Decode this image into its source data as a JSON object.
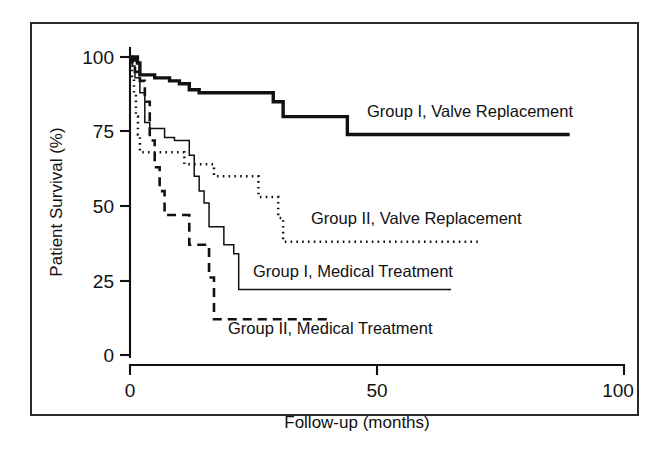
{
  "figure": {
    "kind": "kaplan-meier-survival-plot",
    "background_color": "#ffffff",
    "ink_color": "#111111",
    "frame": {
      "border_color": "#2a2a2a"
    }
  },
  "chart_data": {
    "type": "line",
    "title": "",
    "xlabel": "Follow-up (months)",
    "ylabel": "Patient Survival (%)",
    "xlim": [
      0,
      100
    ],
    "ylim": [
      0,
      100
    ],
    "xticks": [
      0,
      50,
      100
    ],
    "xtick_labels": [
      "0",
      "50",
      "100"
    ],
    "yticks": [
      0,
      25,
      50,
      75,
      100
    ],
    "ytick_labels": [
      "0",
      "25",
      "50",
      "75",
      "100"
    ],
    "grid": false,
    "legend_position": "inline-annotations",
    "step_style": "post",
    "series": [
      {
        "name": "Group I, Valve Replacement",
        "style": "solid-thick",
        "label_x": 62,
        "label_y": 80,
        "x": [
          0,
          0.5,
          1.0,
          1.5,
          2.0,
          3.0,
          5.0,
          8.0,
          10.0,
          12.0,
          14.0,
          26.0,
          29.0,
          31.0,
          44.0,
          89.0
        ],
        "y": [
          100,
          99,
          100,
          98,
          94,
          94,
          93,
          92,
          91,
          89,
          88,
          88,
          85,
          80,
          74,
          74
        ]
      },
      {
        "name": "Group I, Medical Treatment",
        "style": "solid-thin",
        "label_x": 25,
        "label_y": 27,
        "x": [
          0,
          0.5,
          1.0,
          2.0,
          3.0,
          4.0,
          5.0,
          7.0,
          9.0,
          11.0,
          12.0,
          13.0,
          14.0,
          15.0,
          16.0,
          17.0,
          19.0,
          21.0,
          22.0,
          65.0
        ],
        "y": [
          99,
          97,
          93,
          88,
          78,
          76,
          76,
          73,
          72,
          72,
          67,
          60,
          55,
          51,
          43,
          43,
          37,
          34,
          22,
          22
        ]
      },
      {
        "name": "Group II, Valve Replacement",
        "style": "dotted",
        "label_x": 34,
        "label_y": 45,
        "x": [
          0,
          0.4,
          0.8,
          1.2,
          1.6,
          2.0,
          5.0,
          9.0,
          11.0,
          13.0,
          17.0,
          24.0,
          26.0,
          28.0,
          30.0,
          31.0,
          71.0
        ],
        "y": [
          97,
          93,
          88,
          80,
          74,
          68,
          68,
          68,
          64,
          64,
          60,
          60,
          53,
          53,
          46,
          38,
          38
        ]
      },
      {
        "name": "Group II, Medical Treatment",
        "style": "dashed",
        "label_x": 21,
        "label_y": 6,
        "x": [
          0,
          0.5,
          1.0,
          2.0,
          3.0,
          4.0,
          5.0,
          6.0,
          7.0,
          9.0,
          12.0,
          13.0,
          15.0,
          16.0,
          17.0,
          41.0
        ],
        "y": [
          100,
          98,
          95,
          92,
          85,
          72,
          63,
          55,
          47,
          47,
          37,
          37,
          37,
          26,
          12,
          12
        ]
      }
    ]
  },
  "axes": {
    "y_axis_title": "Patient Survival (%)",
    "x_axis_title": "Follow-up (months)",
    "y_tick_labels": [
      "100",
      "75",
      "50",
      "25",
      "0"
    ],
    "x_tick_labels": [
      "0",
      "50",
      "100"
    ]
  },
  "annotations": [
    {
      "id": "label-group1-valve",
      "text": "Group I, Valve Replacement"
    },
    {
      "id": "label-group2-valve",
      "text": "Group II, Valve Replacement"
    },
    {
      "id": "label-group1-medical",
      "text": "Group I, Medical Treatment"
    },
    {
      "id": "label-group2-medical",
      "text": "Group II, Medical Treatment"
    }
  ]
}
